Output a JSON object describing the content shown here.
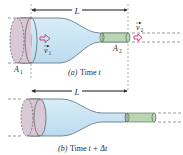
{
  "diagram": {
    "topic": "Fluid flow through a tapered pipe",
    "colors": {
      "fluid": "#cfe6f3",
      "fluid_edge": "#5a6f7c",
      "wide_disc": "#d9c9d6",
      "narrow_cylinder": "#b9d6b2",
      "arrow": "#d0306a",
      "dashed": "#555555"
    },
    "panel_a": {
      "caption_prefix": "(a)",
      "caption_text": "Time ",
      "caption_var": "t",
      "length_label": "L",
      "area_left": "A",
      "area_left_sub": "1",
      "area_right": "A",
      "area_right_sub": "2",
      "velocity_left": "v",
      "velocity_left_sub": "1",
      "velocity_right": "v",
      "velocity_right_sub": "2"
    },
    "panel_b": {
      "caption_prefix": "(b)",
      "caption_text": "Time ",
      "caption_var": "t + Δt",
      "length_label": "L"
    }
  }
}
